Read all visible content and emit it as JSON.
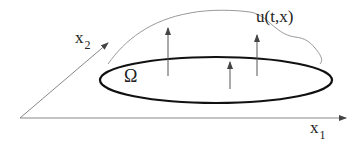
{
  "diagram": {
    "labels": {
      "x1": "x",
      "x1_sub": "1",
      "x2": "x",
      "x2_sub": "2",
      "domain": "Ω",
      "function": "u(t,x)"
    },
    "colors": {
      "axis": "#888888",
      "ellipse": "#111111",
      "curve": "#999999",
      "arrows": "#555555"
    }
  }
}
